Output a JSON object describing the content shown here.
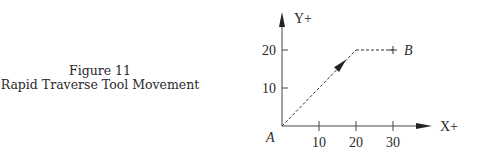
{
  "caption": {
    "figure_number": "Figure 11",
    "title": "Rapid Traverse Tool Movement"
  },
  "diagram": {
    "x_axis_label": "X+",
    "y_axis_label": "Y+",
    "x_ticks": [
      "10",
      "20",
      "30"
    ],
    "y_ticks": [
      "10",
      "20"
    ],
    "start_point_label": "A",
    "end_point_label": "B",
    "path_points": [
      [
        0,
        0
      ],
      [
        20,
        20
      ],
      [
        30,
        20
      ]
    ],
    "path_style": "dashed",
    "line_color": "#333333"
  }
}
